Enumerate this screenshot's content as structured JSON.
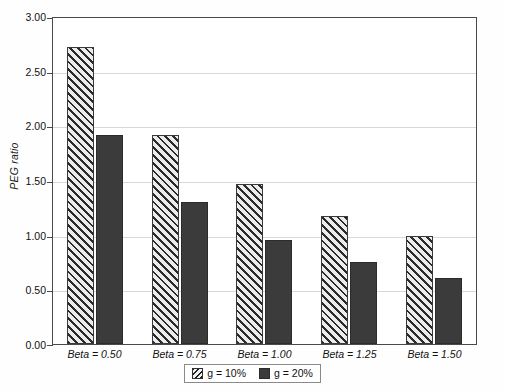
{
  "chart_data": {
    "type": "bar",
    "title": "",
    "xlabel": "",
    "ylabel": "PEG ratio",
    "categories": [
      "Beta = 0.50",
      "Beta = 0.75",
      "Beta = 1.00",
      "Beta = 1.25",
      "Beta = 1.50"
    ],
    "series": [
      {
        "name": "g = 10%",
        "values": [
          2.72,
          1.91,
          1.46,
          1.17,
          0.99
        ],
        "style": "hatched"
      },
      {
        "name": "g = 20%",
        "values": [
          1.91,
          1.3,
          0.95,
          0.75,
          0.6
        ],
        "style": "solid"
      }
    ],
    "ylim": [
      0.0,
      3.0
    ],
    "ytick_values": [
      0.0,
      0.5,
      1.0,
      1.5,
      2.0,
      2.5,
      3.0
    ],
    "ytick_labels": [
      "0.00",
      "0.50",
      "1.00",
      "1.50",
      "2.00",
      "2.50",
      "3.00"
    ],
    "grid": true,
    "legend_position": "bottom-center",
    "colors": {
      "series_solid": "#3b3b3b",
      "series_hatch_fill": "#e9e9e9",
      "series_hatch_line": "#2a2a2a",
      "gridline": "#d8d8d8",
      "axis": "#4a4a4a",
      "background": "#ffffff",
      "text": "#111111"
    }
  },
  "legend": {
    "items": [
      {
        "label": "g = 10%"
      },
      {
        "label": "g = 20%"
      }
    ]
  }
}
